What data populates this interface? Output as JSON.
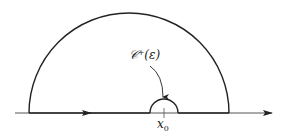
{
  "diagram": {
    "type": "contour",
    "labels": {
      "small_arc": "𝒞⁺(ε)",
      "point": "x",
      "point_subscript": "0"
    },
    "geometry": {
      "baseline_y": 113,
      "axis_x_start": 15,
      "axis_x_end": 272,
      "large_arc": {
        "cx": 129,
        "r": 100
      },
      "small_arc": {
        "cx": 164,
        "r": 14
      }
    },
    "colors": {
      "stroke": "#222222",
      "axis": "#555555"
    }
  }
}
